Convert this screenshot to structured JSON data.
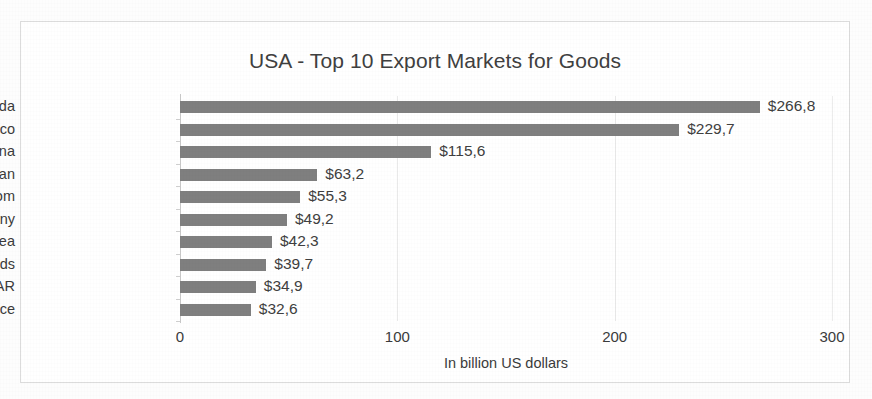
{
  "chart_data": {
    "type": "bar",
    "orientation": "horizontal",
    "title": "USA - Top 10 Export Markets for Goods",
    "xlabel": "In billion US dollars",
    "ylabel": "",
    "xlim": [
      0,
      300
    ],
    "xticks": [
      "0",
      "100",
      "200",
      "300"
    ],
    "xtick_values": [
      0,
      100,
      200,
      300
    ],
    "grid": true,
    "legend": false,
    "categories": [
      "Canada",
      "Mexico",
      "China",
      "Japan",
      "United Kingdom",
      "Germany",
      "Rep. of Korea",
      "Netherlands",
      "Hong Kong SAR",
      "France"
    ],
    "values": [
      266.8,
      229.7,
      115.6,
      63.2,
      55.3,
      49.2,
      42.3,
      39.7,
      34.9,
      32.6
    ],
    "data_labels": [
      "$266,8",
      "$229,7",
      "$115,6",
      "$63,2",
      "$55,3",
      "$49,2",
      "$42,3",
      "$39,7",
      "$34,9",
      "$32,6"
    ],
    "bar_color": "#7f7f7f",
    "gridline_color": "#e9e9e9",
    "frame_color": "#dcdcdc",
    "text_color": "#3f3f3f"
  }
}
